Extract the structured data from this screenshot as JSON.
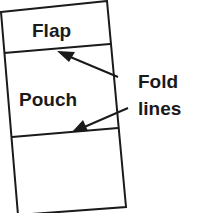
{
  "diagram": {
    "sections": [
      {
        "label": "Flap"
      },
      {
        "label": "Pouch"
      },
      {
        "label": ""
      }
    ],
    "callout": {
      "line1": "Fold",
      "line2": "lines",
      "arrow_count": 2
    },
    "colors": {
      "stroke": "#1a1a1a",
      "background": "#ffffff"
    }
  }
}
